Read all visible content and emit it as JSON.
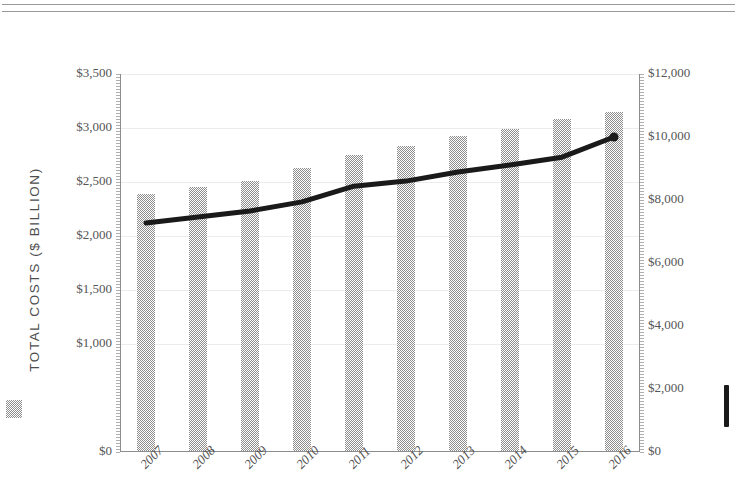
{
  "header": {
    "rules": [
      "top-rule-1",
      "top-rule-2"
    ]
  },
  "legend": {
    "bar_swatch_name": "total-costs-swatch",
    "line_swatch_name": "cost-per-capita-swatch",
    "bar_color": "#8d8d8d",
    "line_color": "#1a1a1a"
  },
  "axes": {
    "left_title": "TOTAL COSTS ($ BILLION)",
    "right_title": "COST PER CAPITA",
    "left_ticks": [
      "$3,500",
      "$3,000",
      "$2,500",
      "$2,000",
      "$1,500",
      "$1,000",
      "$0"
    ],
    "right_ticks": [
      "$12,000",
      "$10,000",
      "$8,000",
      "$6,000",
      "$4,000",
      "$2,000",
      "$0"
    ]
  },
  "chart_data": {
    "type": "bar",
    "title": "",
    "subtitle": "",
    "xlabel": "",
    "ylabel": "TOTAL COSTS ($ BILLION)",
    "y2label": "COST PER CAPITA",
    "categories": [
      "2007",
      "2008",
      "2009",
      "2010",
      "2011",
      "2012",
      "2013",
      "2014",
      "2015",
      "2016"
    ],
    "ylim": [
      0,
      3500
    ],
    "y2lim": [
      0,
      12000
    ],
    "yticks": [
      0,
      1000,
      1500,
      2000,
      2500,
      3000,
      3500
    ],
    "ytick_labels": [
      "$0",
      "$1,000",
      "$1,500",
      "$2,000",
      "$2,500",
      "$3,000",
      "$3,500"
    ],
    "y2ticks": [
      0,
      2000,
      4000,
      6000,
      8000,
      10000,
      12000
    ],
    "y2tick_labels": [
      "$0",
      "$2,000",
      "$4,000",
      "$6,000",
      "$8,000",
      "$10,000",
      "$12,000"
    ],
    "grid": true,
    "grid_axis": "y",
    "legend_position": "outside-left-and-right",
    "series": [
      {
        "name": "TOTAL COSTS ($ BILLION)",
        "type": "bar",
        "axis": "left",
        "color": "#8d8d8d",
        "values": [
          2380,
          2440,
          2500,
          2620,
          2740,
          2820,
          2920,
          2980,
          3070,
          3140
        ]
      },
      {
        "name": "COST PER CAPITA",
        "type": "line",
        "axis": "right",
        "color": "#1a1a1a",
        "values": [
          7270,
          7460,
          7650,
          7940,
          8440,
          8600,
          8890,
          9110,
          9360,
          10000
        ]
      }
    ]
  }
}
